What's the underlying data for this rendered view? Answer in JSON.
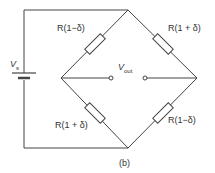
{
  "diagram": {
    "type": "wheatstone-bridge",
    "caption": "(b)",
    "source": {
      "symbol": "V",
      "subscript": "s"
    },
    "output": {
      "symbol": "V",
      "subscript": "out"
    },
    "resistors": [
      {
        "position": "top-left",
        "label": "R(1−δ)"
      },
      {
        "position": "top-right",
        "label": "R(1 + δ)"
      },
      {
        "position": "bottom-left",
        "label": "R(1 + δ)"
      },
      {
        "position": "bottom-right",
        "label": "R(1−δ)"
      }
    ],
    "colors": {
      "line": "#444444",
      "text": "#333333"
    }
  }
}
